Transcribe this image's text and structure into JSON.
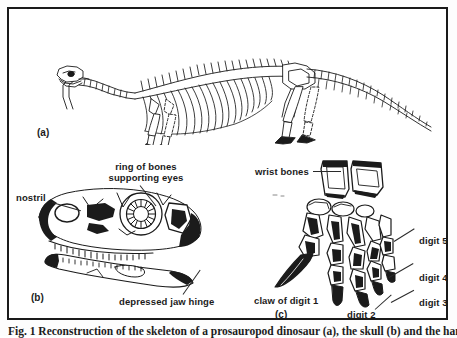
{
  "figure": {
    "caption": "Fig. 1 Reconstruction of the skeleton of a prosauropod dinosaur (a), the skull (b) and the hand (c)",
    "frame_color": "#1a1a1a",
    "background_color": "#ffffff",
    "ink_color": "#1b1b1b"
  },
  "panels": [
    {
      "tag": "(a)",
      "name": "skeleton-panel",
      "subject": "full dinosaur skeleton in lateral view",
      "labels": []
    },
    {
      "tag": "(b)",
      "name": "skull-panel",
      "subject": "dinosaur skull in lateral view",
      "labels": [
        {
          "id": "nostril",
          "text": "nostril"
        },
        {
          "id": "ring-of-bones",
          "line1": "ring of bones",
          "line2": "supporting eyes"
        },
        {
          "id": "depressed-jaw-hinge",
          "text": "depressed jaw hinge"
        }
      ]
    },
    {
      "tag": "(c)",
      "name": "hand-panel",
      "subject": "dinosaur hand and wrist bones",
      "labels": [
        {
          "id": "wrist-bones",
          "text": "wrist bones"
        },
        {
          "id": "digit-5",
          "text": "digit 5"
        },
        {
          "id": "digit-4",
          "text": "digit 4"
        },
        {
          "id": "digit-3",
          "text": "digit 3"
        },
        {
          "id": "digit-2",
          "text": "digit 2"
        },
        {
          "id": "claw-of-digit-1",
          "text": "claw of digit 1"
        }
      ]
    }
  ],
  "labels": {
    "panel_a_tag": "(a)",
    "panel_b_tag": "(b)",
    "panel_c_tag": "(c)",
    "nostril": "nostril",
    "ring_of_bones_line1": "ring of bones",
    "ring_of_bones_line2": "supporting eyes",
    "depressed_jaw_hinge": "depressed jaw hinge",
    "wrist_bones": "wrist bones",
    "digit_5": "digit 5",
    "digit_4": "digit 4",
    "digit_3": "digit 3",
    "digit_2": "digit 2",
    "claw_of_digit_1": "claw of digit 1"
  }
}
